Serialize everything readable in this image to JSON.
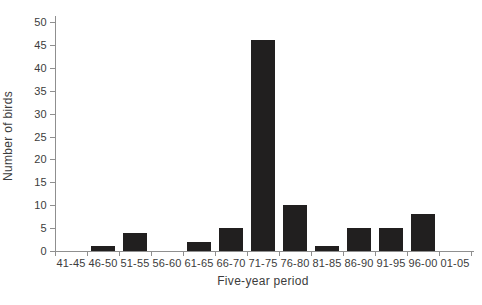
{
  "chart_data": {
    "type": "bar",
    "title": "",
    "categories": [
      "41-45",
      "46-50",
      "51-55",
      "56-60",
      "61-65",
      "66-70",
      "71-75",
      "76-80",
      "81-85",
      "86-90",
      "91-95",
      "96-00",
      "01-05"
    ],
    "values": [
      0,
      1,
      4,
      0,
      2,
      5,
      46,
      10,
      1,
      5,
      5,
      8,
      0
    ],
    "xlabel": "Five-year period",
    "ylabel": "Number of birds",
    "ylim": [
      0,
      50
    ],
    "ytick_step": 5,
    "yticks": [
      0,
      5,
      10,
      15,
      20,
      25,
      30,
      35,
      40,
      45,
      50
    ],
    "grid": false,
    "legend": false,
    "colors": {
      "bar": "#211f1f",
      "axis": "#8f8f8f",
      "text": "#3c3c3c",
      "background": "#ffffff"
    }
  }
}
